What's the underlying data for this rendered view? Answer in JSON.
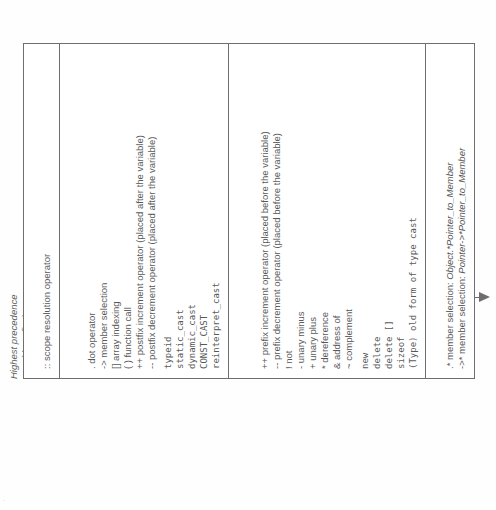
{
  "document": {
    "kind": "cpp-operator-precedence-table",
    "orientation_degrees": -90
  },
  "axis": {
    "high_label_line1": "Highest precedence",
    "high_label_line2": "(done first)",
    "low_label": "Lower precedence",
    "arrow_direction": "highest-to-lower",
    "arrow_color": "#6d6d6d"
  },
  "table": {
    "border_color": "#6f6f6f",
    "groups": [
      {
        "name": "scope-resolution",
        "entries": [
          {
            "text": ":: scope resolution operator",
            "style": "normal"
          }
        ]
      },
      {
        "name": "postfix-and-member-access",
        "entries": [
          {
            "text": ".  dot operator",
            "style": "normal"
          },
          {
            "text": "-> member selection",
            "style": "normal"
          },
          {
            "text": "[] array indexing",
            "style": "normal"
          },
          {
            "text": "( ) function call",
            "style": "normal"
          },
          {
            "text": "++ postfix increment operator (placed after the variable)",
            "style": "normal"
          },
          {
            "text": "-- postfix decrement operator (placed after the variable)",
            "style": "normal"
          },
          {
            "text": "typeid",
            "style": "mono"
          },
          {
            "text": "static_cast",
            "style": "mono"
          },
          {
            "text": "dynamic_cast",
            "style": "mono"
          },
          {
            "text": "CONST_CAST",
            "style": "mono"
          },
          {
            "text": "reinterpret_cast",
            "style": "mono"
          }
        ]
      },
      {
        "name": "unary-operators",
        "entries": [
          {
            "text": "++ prefix increment operator (placed before the variable)",
            "style": "normal"
          },
          {
            "text": "-- prefix decrement operator (placed before the variable)",
            "style": "normal"
          },
          {
            "text": "! not",
            "style": "normal"
          },
          {
            "text": "-  unary minus",
            "style": "normal"
          },
          {
            "text": "+  unary plus",
            "style": "normal"
          },
          {
            "text": "*  dereference",
            "style": "normal"
          },
          {
            "text": "&  address of",
            "style": "normal"
          },
          {
            "text": "~  complement",
            "style": "normal"
          },
          {
            "text": "new",
            "style": "mono"
          },
          {
            "text": "delete",
            "style": "mono"
          },
          {
            "text": "delete []",
            "style": "mono"
          },
          {
            "text": "sizeof",
            "style": "mono"
          },
          {
            "text": "(Type) old form of type cast",
            "style": "mono"
          }
        ]
      },
      {
        "name": "pointer-to-member",
        "entries": [
          {
            "text": ".* member selection: ",
            "italic_tail": "Object.*Pointer_to_Member",
            "style": "italic-tail"
          },
          {
            "text": "->* member selection: ",
            "italic_tail": "Pointer->*Pointer_to_Member",
            "style": "italic-tail"
          }
        ]
      }
    ]
  }
}
